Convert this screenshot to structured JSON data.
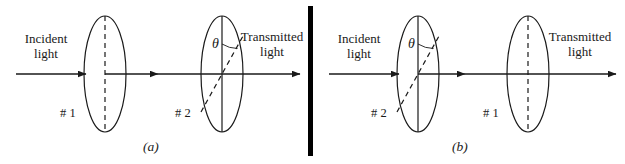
{
  "figure": {
    "background_color": "#ffffff",
    "stroke_color": "#1a1a1a",
    "divider_color": "#000000",
    "panels": [
      {
        "caption": "(a)",
        "incident_label_line1": "Incident",
        "incident_label_line2": "light",
        "transmitted_label_line1": "Transmitted",
        "transmitted_label_line2": "light",
        "angle_symbol": "θ",
        "polarizers": [
          {
            "label": "# 1",
            "axis": "vertical-dashed"
          },
          {
            "label": "# 2",
            "axis": "tilted-dashed-with-angle"
          }
        ]
      },
      {
        "caption": "(b)",
        "incident_label_line1": "Incident",
        "incident_label_line2": "light",
        "transmitted_label_line1": "Transmitted",
        "transmitted_label_line2": "light",
        "angle_symbol": "θ",
        "polarizers": [
          {
            "label": "# 2",
            "axis": "tilted-dashed-with-angle"
          },
          {
            "label": "# 1",
            "axis": "vertical-dashed"
          }
        ]
      }
    ]
  }
}
